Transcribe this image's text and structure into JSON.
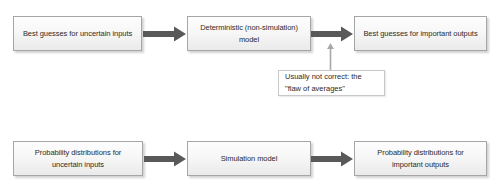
{
  "diagram": {
    "colors": {
      "box_border": "#a6a6a6",
      "box_fill_top": "#fdfdfd",
      "box_fill_bottom": "#eaeaea",
      "arrow_dark": "#595959",
      "arrow_light": "#a9a9a9",
      "note_border": "#c8c8c8",
      "text": "#2b2b2b",
      "background": "#ffffff"
    },
    "top_row": {
      "input_box": "Best guesses for uncertain inputs",
      "model_box": "Deterministic (non-simulation) model",
      "output_box": "Best guesses for important outputs"
    },
    "bottom_row": {
      "input_box": "Probability distributions for uncertain inputs",
      "model_box": "Simulation model",
      "output_box": "Probability distributions for important outputs"
    },
    "note": "Usually not correct: the \"flaw of averages\"",
    "arrows": {
      "top_input_to_model": "arrow-right",
      "top_model_to_output": "arrow-right",
      "note_to_output": "arrow-up",
      "bottom_input_to_model": "arrow-right",
      "bottom_model_to_output": "arrow-right"
    }
  }
}
